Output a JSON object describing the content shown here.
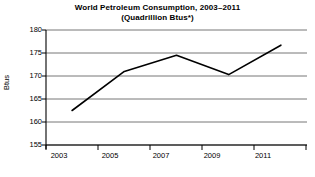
{
  "chart_data": {
    "type": "line",
    "title": "World Petroleum Consumption, 2003–2011",
    "subtitle": "(Quadrillion Btus*)",
    "xlabel": "",
    "ylabel": "Btus",
    "x": [
      2003,
      2005,
      2007,
      2009,
      2011
    ],
    "values": [
      162.5,
      171.0,
      174.5,
      170.3,
      176.7
    ],
    "series": [
      {
        "name": "World Petroleum Consumption",
        "values": [
          162.5,
          171.0,
          174.5,
          170.3,
          176.7
        ]
      }
    ],
    "xlim": [
      2002,
      2012
    ],
    "ylim": [
      155,
      180
    ],
    "ytick_labels": [
      "180",
      "175",
      "170",
      "165",
      "160",
      "155"
    ],
    "ytick_values": [
      180,
      175,
      170,
      165,
      160,
      155
    ],
    "xtick_labels": [
      "2003",
      "2005",
      "2007",
      "2009",
      "2011"
    ],
    "xtick_values": [
      2003,
      2005,
      2007,
      2009,
      2011
    ],
    "xminor_tick_values": [
      2002,
      2004,
      2006,
      2008,
      2010,
      2012
    ],
    "grid": true,
    "grid_axis": "y",
    "legend": false,
    "legend_position": "none",
    "line_color": "#000000",
    "grid_color": "#808080",
    "axis_color": "#000000",
    "background_color": "#ffffff"
  },
  "axis": {
    "y_title": "Btus",
    "ticks_y": [
      {
        "label": "180",
        "value": 180
      },
      {
        "label": "175",
        "value": 175
      },
      {
        "label": "170",
        "value": 170
      },
      {
        "label": "165",
        "value": 165
      },
      {
        "label": "160",
        "value": 160
      },
      {
        "label": "155",
        "value": 155
      }
    ],
    "ticks_x": [
      {
        "label": "2003",
        "value": 2003
      },
      {
        "label": "2005",
        "value": 2005
      },
      {
        "label": "2007",
        "value": 2007
      },
      {
        "label": "2009",
        "value": 2009
      },
      {
        "label": "2011",
        "value": 2011
      }
    ]
  },
  "header": {
    "title_line_1": "World Petroleum Consumption, 2003–2011",
    "title_line_2": "(Quadrillion Btus*)"
  }
}
